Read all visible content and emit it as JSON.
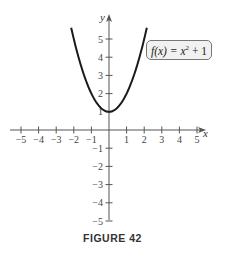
{
  "chart_data": {
    "type": "line",
    "title": "",
    "caption": "FIGURE 42",
    "xlabel": "x",
    "ylabel": "y",
    "xlim": [
      -5.5,
      5.5
    ],
    "ylim": [
      -5.5,
      5.5
    ],
    "grid": false,
    "x_ticks": [
      -5,
      -4,
      -3,
      -2,
      -1,
      1,
      2,
      3,
      4,
      5
    ],
    "y_ticks": [
      -5,
      -4,
      -3,
      -2,
      -1,
      1,
      2,
      3,
      4,
      5
    ],
    "x_tick_labels": [
      "−5",
      "−4",
      "−3",
      "−2",
      "−1",
      "1",
      "2",
      "3",
      "4",
      "5"
    ],
    "y_tick_labels": [
      "−5",
      "−4",
      "−3",
      "−2",
      "−1",
      "1",
      "2",
      "3",
      "4",
      "5"
    ],
    "series": [
      {
        "name": "f(x) = x^2 + 1",
        "function": "x^2 + 1",
        "domain": [
          -2.15,
          2.15
        ],
        "x": [
          -2.1,
          -2,
          -1.5,
          -1,
          -0.5,
          0,
          0.5,
          1,
          1.5,
          2,
          2.1
        ],
        "y": [
          5.41,
          5,
          3.25,
          2,
          1.25,
          1,
          1.25,
          2,
          3.25,
          5,
          5.41
        ]
      }
    ],
    "legend": {
      "label_prefix": "f(x) = x",
      "label_exp": "2",
      "label_suffix": " + 1",
      "position": "upper right, near curve"
    }
  },
  "figure": {
    "caption": "FIGURE 42"
  }
}
